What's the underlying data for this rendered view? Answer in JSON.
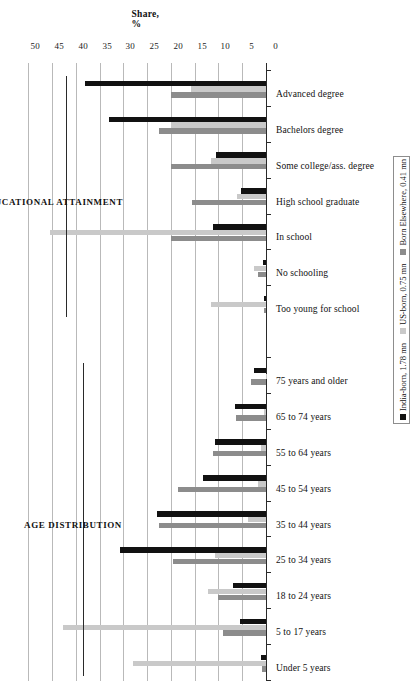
{
  "chart_data": {
    "type": "bar",
    "orientation": "horizontal",
    "title": "",
    "xlabel": "",
    "ylabel": "Share, %",
    "axis_title": "Share, %",
    "ylim": [
      0,
      50
    ],
    "tick_labels": [
      "50",
      "45",
      "40",
      "35",
      "30",
      "25",
      "20",
      "15",
      "10",
      "5",
      "0"
    ],
    "tick_values": [
      50,
      45,
      40,
      35,
      30,
      25,
      20,
      15,
      10,
      5,
      0
    ],
    "grid": true,
    "legend_position": "right",
    "series": [
      {
        "name": "India-born, 1.78 mn",
        "color": "#111111",
        "values": [
          1.0,
          5.5,
          7.0,
          30.7,
          23.0,
          13.3,
          10.7,
          6.6,
          2.6,
          0.5,
          0.6,
          5.2,
          10.6,
          10.6,
          11.2,
          33.0,
          38.0
        ]
      },
      {
        "name": "US-born, 0.75 mn",
        "color": "#c9c9c9",
        "values": [
          28.0,
          42.7,
          12.3,
          10.7,
          3.7,
          1.7,
          1.0,
          0.4,
          0.1,
          11.5,
          2.6,
          6.0,
          11.5,
          20.0,
          45.5,
          20.0,
          15.8
        ]
      },
      {
        "name": "Born Elsewhere, 0.41 mn",
        "color": "#8c8c8c",
        "values": [
          0.9,
          9.1,
          10.0,
          19.6,
          22.5,
          18.5,
          11.2,
          6.3,
          3.2,
          0.5,
          1.7,
          15.5,
          20.0,
          22.5,
          20.0,
          22.5,
          20.0
        ]
      }
    ],
    "categories": [
      "Under 5 years",
      "5 to 17 years",
      "18 to 24 years",
      "25 to 34 years",
      "35 to 44 years",
      "45 to 54 years",
      "55 to 64 years",
      "65 to 74 years",
      "75 years and older",
      "Too young for school",
      "No schooling",
      "High school graduate",
      "Some college/ass. degree",
      "Bachelors degree",
      "In school",
      "Advanced degree",
      "Advanced degree"
    ],
    "displayed_categories": [
      "Under 5 years",
      "5 to 17 years",
      "18 to 24 years",
      "25 to 34 years",
      "35 to 44 years",
      "45 to 54 years",
      "55 to 64 years",
      "65 to 74 years",
      "75 years and older",
      "Too young for school",
      "No schooling",
      "In school",
      "High school graduate",
      "Some college/ass. degree",
      "Bachelors degree",
      "Advanced degree"
    ],
    "groups": [
      {
        "label": "AGE DISTRIBUTION",
        "from": "Under 5 years",
        "to": "75 years and older"
      },
      {
        "label": "EDUCATIONAL ATTAINMENT",
        "from": "Too young for school",
        "to": "Advanced degree"
      }
    ],
    "group_labels": [
      "AGE DISTRIBUTION",
      "EDUCATIONAL ATTAINMENT"
    ],
    "rows": [
      {
        "category": "Under 5 years",
        "india_born": 1.0,
        "us_born": 28.0,
        "born_elsewhere": 0.9
      },
      {
        "category": "5 to 17 years",
        "india_born": 5.5,
        "us_born": 42.7,
        "born_elsewhere": 9.1
      },
      {
        "category": "18 to 24 years",
        "india_born": 7.0,
        "us_born": 12.3,
        "born_elsewhere": 10.0
      },
      {
        "category": "25 to 34 years",
        "india_born": 30.7,
        "us_born": 10.7,
        "born_elsewhere": 19.6
      },
      {
        "category": "35 to 44 years",
        "india_born": 23.0,
        "us_born": 3.7,
        "born_elsewhere": 22.5
      },
      {
        "category": "45 to 54 years",
        "india_born": 13.3,
        "us_born": 1.7,
        "born_elsewhere": 18.5
      },
      {
        "category": "55 to 64 years",
        "india_born": 10.7,
        "us_born": 1.0,
        "born_elsewhere": 11.2
      },
      {
        "category": "65 to 74 years",
        "india_born": 6.6,
        "us_born": 0.4,
        "born_elsewhere": 6.3
      },
      {
        "category": "75 years and older",
        "india_born": 2.6,
        "us_born": 0.1,
        "born_elsewhere": 3.2
      },
      {
        "category": "Too young for school",
        "india_born": 0.5,
        "us_born": 11.5,
        "born_elsewhere": 0.5
      },
      {
        "category": "No schooling",
        "india_born": 0.6,
        "us_born": 2.6,
        "born_elsewhere": 1.7
      },
      {
        "category": "In school",
        "india_born": 11.2,
        "us_born": 45.5,
        "born_elsewhere": 20.0
      },
      {
        "category": "High school graduate",
        "india_born": 5.2,
        "us_born": 6.0,
        "born_elsewhere": 15.5
      },
      {
        "category": "Some college/ass. degree",
        "india_born": 10.6,
        "us_born": 11.5,
        "born_elsewhere": 20.0
      },
      {
        "category": "Bachelors degree",
        "india_born": 33.0,
        "us_born": 20.0,
        "born_elsewhere": 22.5
      },
      {
        "category": "Advanced degree",
        "india_born": 38.0,
        "us_born": 15.8,
        "born_elsewhere": 20.0
      }
    ],
    "legend": [
      {
        "label": "India-born, 1.78 mn",
        "color": "#111111"
      },
      {
        "label": "US-born, 0.75 mn",
        "color": "#c9c9c9"
      },
      {
        "label": "Born Elsewhere, 0.41 mn",
        "color": "#8c8c8c"
      }
    ]
  }
}
